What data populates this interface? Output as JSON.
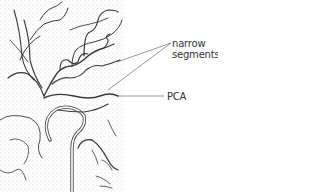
{
  "figure": {
    "labels": {
      "narrow_line1": "narrow",
      "narrow_line2": "segments",
      "pca": "PCA"
    },
    "colors": {
      "line": "#3a3a3a",
      "stipple": "#cfcfcf",
      "background": "#ffffff"
    }
  }
}
